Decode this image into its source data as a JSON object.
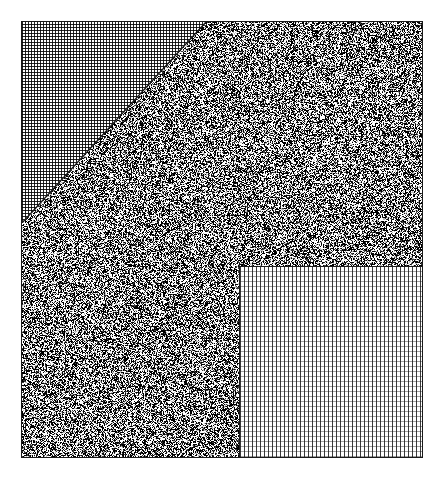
{
  "figure": {
    "title": "Texture Region Diagram",
    "width": 441,
    "height": 477,
    "background_color": "#ffffff",
    "border_color": "#1a1a1a"
  },
  "plate": {
    "name": "outer-frame",
    "x": 21,
    "y": 21,
    "width": 402,
    "height": 437,
    "stroke_color": "#1a1a1a",
    "stroke_width": 1
  },
  "regions": [
    {
      "id": "region-a",
      "label": "dotted-triangle",
      "shape": "triangle",
      "fill_pattern": "fine-dot-halftone",
      "pattern_period_px": 3,
      "pattern_color": "#141414",
      "background_color": "#ffffff",
      "vertices": [
        [
          21,
          21
        ],
        [
          205,
          21
        ],
        [
          21,
          222
        ]
      ],
      "mean_tone": "light"
    },
    {
      "id": "region-b",
      "label": "random-noise-field",
      "shape": "l-shaped-polygon",
      "fill_pattern": "random-salt-and-pepper",
      "pattern_color": "#000000",
      "background_color": "#ffffff",
      "black_fraction": 0.5,
      "mean_tone": "dark",
      "mean_gray_hex": "#6e6e6e"
    },
    {
      "id": "region-c",
      "label": "cross-hatch-grid-rectangle",
      "shape": "rectangle",
      "fill_pattern": "cross-hatch-grid",
      "vertical_line_spacing_px": 4,
      "horizontal_line_spacing_px": 5,
      "vertical_line_color": "#191919",
      "horizontal_line_color": "#6e6e6e",
      "background_color": "#ffffff",
      "x": 238,
      "y": 265,
      "width": 185,
      "height": 193,
      "mean_tone": "light"
    }
  ],
  "noise": {
    "seed": 20240917,
    "density": 0.5,
    "dot_color": "#000000",
    "base_color": "#ffffff"
  },
  "legend": {
    "present": false,
    "entries": []
  },
  "annotations": {
    "present": false,
    "items": []
  }
}
